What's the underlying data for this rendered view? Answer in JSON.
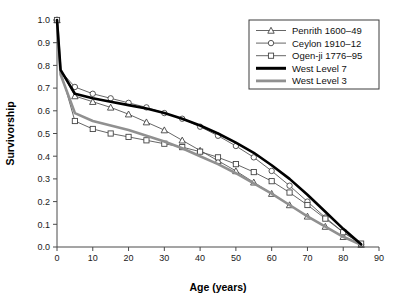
{
  "chart_data": {
    "type": "line",
    "title": "",
    "xlabel": "Age (years)",
    "ylabel": "Survivorship",
    "xlim": [
      0,
      90
    ],
    "ylim": [
      0.0,
      1.0
    ],
    "xticks": [
      0,
      10,
      20,
      30,
      40,
      50,
      60,
      70,
      80,
      90
    ],
    "xticklabels": [
      "0",
      "10",
      "20",
      "30",
      "40",
      "50",
      "60",
      "70",
      "80",
      "90"
    ],
    "yticks": [
      0.0,
      0.1,
      0.2,
      0.3,
      0.4,
      0.5,
      0.6,
      0.7,
      0.8,
      0.9,
      1.0
    ],
    "yticklabels": [
      "0.0",
      "0.1",
      "0.2",
      "0.3",
      "0.4",
      "0.5",
      "0.6",
      "0.7",
      "0.8",
      "0.9",
      "1.0"
    ],
    "grid": false,
    "legend_position": "upper right",
    "series": [
      {
        "name": "Penrith 1600–49",
        "marker": "triangle",
        "style": "thin-line-open-marker",
        "color": "#555555",
        "x": [
          0,
          1,
          5,
          10,
          15,
          20,
          25,
          30,
          35,
          40,
          45,
          50,
          55,
          60,
          65,
          70,
          75,
          80,
          85
        ],
        "y": [
          1.0,
          0.78,
          0.665,
          0.64,
          0.615,
          0.585,
          0.55,
          0.515,
          0.47,
          0.425,
          0.38,
          0.335,
          0.285,
          0.235,
          0.185,
          0.135,
          0.09,
          0.045,
          0.01
        ]
      },
      {
        "name": "Ceylon 1910–12",
        "marker": "circle",
        "style": "thin-line-open-marker",
        "color": "#555555",
        "x": [
          0,
          1,
          5,
          10,
          15,
          20,
          25,
          30,
          35,
          40,
          45,
          50,
          55,
          60,
          65,
          70,
          75,
          80,
          85
        ],
        "y": [
          1.0,
          0.775,
          0.705,
          0.675,
          0.655,
          0.635,
          0.615,
          0.59,
          0.565,
          0.53,
          0.49,
          0.445,
          0.395,
          0.335,
          0.27,
          0.2,
          0.13,
          0.065,
          0.012
        ]
      },
      {
        "name": "Ogen-ji 1776–95",
        "marker": "square",
        "style": "thin-line-open-marker",
        "color": "#555555",
        "x": [
          0,
          1,
          5,
          10,
          15,
          20,
          25,
          30,
          35,
          40,
          45,
          50,
          55,
          60,
          65,
          70,
          75,
          80,
          85
        ],
        "y": [
          1.0,
          0.775,
          0.555,
          0.52,
          0.5,
          0.485,
          0.47,
          0.455,
          0.44,
          0.42,
          0.395,
          0.365,
          0.33,
          0.29,
          0.24,
          0.185,
          0.125,
          0.065,
          0.015
        ]
      },
      {
        "name": "West Level 7",
        "marker": "none",
        "style": "thick-black",
        "color": "#000000",
        "x": [
          0,
          1,
          5,
          10,
          15,
          20,
          25,
          30,
          35,
          40,
          45,
          50,
          55,
          60,
          65,
          70,
          75,
          80,
          85
        ],
        "y": [
          1.0,
          0.78,
          0.675,
          0.655,
          0.64,
          0.625,
          0.61,
          0.59,
          0.565,
          0.535,
          0.5,
          0.46,
          0.415,
          0.36,
          0.3,
          0.23,
          0.155,
          0.08,
          0.012
        ]
      },
      {
        "name": "West Level 3",
        "marker": "none",
        "style": "thick-gray",
        "color": "#909090",
        "x": [
          0,
          1,
          5,
          10,
          15,
          20,
          25,
          30,
          35,
          40,
          45,
          50,
          55,
          60,
          65,
          70,
          75,
          80,
          85
        ],
        "y": [
          1.0,
          0.76,
          0.59,
          0.555,
          0.535,
          0.515,
          0.49,
          0.465,
          0.435,
          0.4,
          0.365,
          0.325,
          0.28,
          0.235,
          0.185,
          0.135,
          0.09,
          0.045,
          0.01
        ]
      }
    ]
  },
  "legend": {
    "entries": [
      {
        "label": "Penrith 1600–49"
      },
      {
        "label": "Ceylon 1910–12"
      },
      {
        "label": "Ogen-ji 1776–95"
      },
      {
        "label": "West Level 7"
      },
      {
        "label": "West Level 3"
      }
    ]
  }
}
